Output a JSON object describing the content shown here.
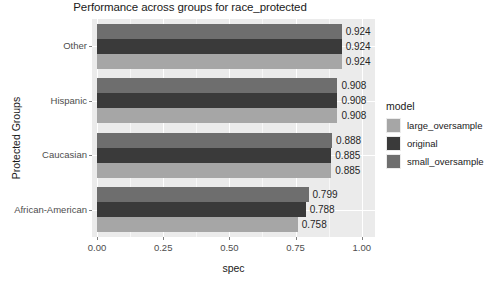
{
  "chart_data": {
    "type": "bar",
    "orientation": "horizontal",
    "title": "Performance across groups for race_protected",
    "xlabel": "spec",
    "ylabel": "Protected Groups",
    "categories": [
      "Other",
      "Hispanic",
      "Caucasian",
      "African-American"
    ],
    "xlim": [
      0,
      1.05
    ],
    "xticks": [
      "0.00",
      "0.25",
      "0.50",
      "0.75",
      "1.00"
    ],
    "xtick_values": [
      0.0,
      0.25,
      0.5,
      0.75,
      1.0
    ],
    "grid": true,
    "legend_position": "right",
    "legend_title": "model",
    "series": [
      {
        "name": "large_oversample",
        "color": "#a6a6a6",
        "values": [
          0.924,
          0.908,
          0.885,
          0.758
        ],
        "labels": [
          "0.924",
          "0.908",
          "0.885",
          "0.758"
        ]
      },
      {
        "name": "original",
        "color": "#3a3a3a",
        "values": [
          0.924,
          0.908,
          0.885,
          0.788
        ],
        "labels": [
          "0.924",
          "0.908",
          "0.885",
          "0.788"
        ]
      },
      {
        "name": "small_oversample",
        "color": "#6e6e6e",
        "values": [
          0.924,
          0.908,
          0.888,
          0.799
        ],
        "labels": [
          "0.924",
          "0.908",
          "0.888",
          "0.799"
        ]
      }
    ],
    "bar_order_top_to_bottom": [
      "small_oversample",
      "original",
      "large_oversample"
    ],
    "panel_background": "#ebebeb",
    "gridline_color": "#ffffff"
  }
}
